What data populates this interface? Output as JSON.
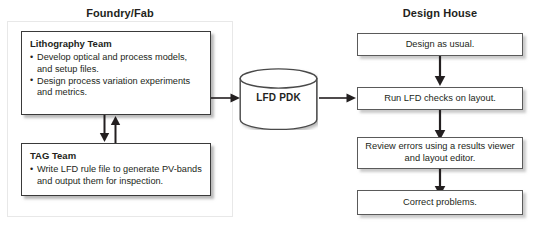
{
  "diagram": {
    "columns": {
      "foundry_heading": "Foundry/Fab",
      "design_heading": "Design House"
    },
    "foundry": {
      "lithography": {
        "title": "Lithography Team",
        "bullets": [
          "Develop optical and process models, and setup files.",
          "Design process variation experiments and metrics."
        ]
      },
      "tag": {
        "title": "TAG Team",
        "bullets": [
          "Write LFD rule file to generate PV-bands and output them for inspection."
        ]
      }
    },
    "database": {
      "label": "LFD PDK",
      "shape": "cylinder"
    },
    "design_house": {
      "steps": [
        {
          "label": "Design as usual."
        },
        {
          "label": "Run LFD checks on layout."
        },
        {
          "label": "Review errors using a results viewer and layout editor."
        },
        {
          "label": "Correct problems."
        }
      ]
    },
    "connectors": [
      {
        "name": "lithography-to-tag",
        "direction": "down"
      },
      {
        "name": "tag-to-lithography",
        "direction": "up"
      },
      {
        "name": "foundry-to-pdk",
        "direction": "right"
      },
      {
        "name": "pdk-to-design-house",
        "direction": "right"
      },
      {
        "name": "design-to-run-checks",
        "direction": "down"
      },
      {
        "name": "run-checks-to-review",
        "direction": "down"
      },
      {
        "name": "review-to-correct",
        "direction": "down"
      }
    ],
    "colors": {
      "text": "#231f20",
      "box_border": "#3a3a3a",
      "thin_border": "#5a5a5a",
      "shadow": "#8c8c8c",
      "background": "#ffffff"
    }
  }
}
